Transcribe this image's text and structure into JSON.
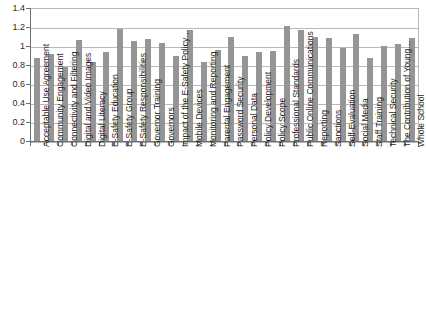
{
  "chart_data": {
    "type": "bar",
    "title": "",
    "subtitle": "",
    "xlabel": "",
    "ylabel": "",
    "ylim": [
      0,
      1.4
    ],
    "ytick_labels": [
      "1.4",
      "1.2",
      "1",
      "0.8",
      "0.6",
      "0.4",
      "0.2",
      "0"
    ],
    "ytick_values": [
      1.4,
      1.2,
      1.0,
      0.8,
      0.6,
      0.4,
      0.2,
      0
    ],
    "grid": true,
    "legend": null,
    "legend_position": "none",
    "bar_color": "#959595",
    "gridline_color": "#b9b9b9",
    "axis_color": "#6f6f6f",
    "categories": [
      "Acceptable Use Agreement",
      "Community Engagement",
      "Connectivity and Filtering",
      "Digital and Video Images",
      "Digital Literacy",
      "E-Safety Education",
      "E-Safety Group",
      "E-Safety Responsibilities",
      "Governor Training",
      "Governors",
      "Impact of the E-Safety Policy…",
      "Mobile Devices",
      "Monitoring and Reporting",
      "Parental Engagement",
      "Password Security",
      "Personal Data",
      "Policy Development",
      "Policy Scope",
      "Professional Standards",
      "Public Online Communications",
      "Reporting",
      "Sanctions",
      "Self-Evaluation",
      "Social Media",
      "Staff Training",
      "Technical Security",
      "The Contribution of Young…",
      "Whole School"
    ],
    "values": [
      0.87,
      0.92,
      0.78,
      1.06,
      0.83,
      0.94,
      1.18,
      1.05,
      1.07,
      1.03,
      0.89,
      1.17,
      0.83,
      0.96,
      1.1,
      0.89,
      0.94,
      0.95,
      1.21,
      1.17,
      1.1,
      1.08,
      0.98,
      1.13,
      0.87,
      1.0,
      1.02,
      1.08
    ]
  }
}
